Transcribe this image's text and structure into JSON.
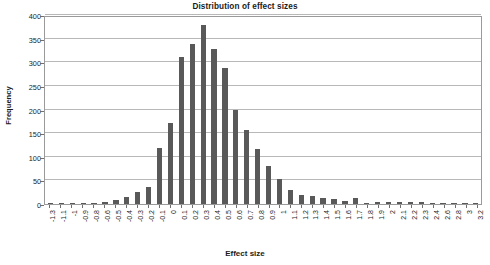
{
  "chart_data": {
    "type": "bar",
    "title": "Distribution of effect sizes",
    "xlabel": "Effect size",
    "ylabel": "Frequency",
    "ylim": [
      0,
      400
    ],
    "ytick_step": 50,
    "yticks": [
      0,
      50,
      100,
      150,
      200,
      250,
      300,
      350,
      400
    ],
    "grid": true,
    "legend": false,
    "bar_color": "#595959",
    "categories": [
      "-1.3",
      "-1.1",
      "-1",
      "-0.9",
      "-0.8",
      "-0.6",
      "-0.5",
      "-0.4",
      "-0.3",
      "-0.2",
      "-0.1",
      "0",
      "0.1",
      "0.2",
      "0.3",
      "0.4",
      "0.5",
      "0.6",
      "0.7",
      "0.8",
      "0.9",
      "1",
      "1.1",
      "1.2",
      "1.3",
      "1.4",
      "1.5",
      "1.6",
      "1.7",
      "1.8",
      "1.9",
      "2",
      "2.1",
      "2.2",
      "2.3",
      "2.4",
      "2.6",
      "2.8",
      "3",
      "3.2"
    ],
    "values": [
      2,
      2,
      2,
      2,
      2,
      4,
      9,
      15,
      25,
      35,
      118,
      172,
      311,
      338,
      378,
      329,
      288,
      200,
      157,
      117,
      80,
      53,
      29,
      20,
      16,
      12,
      10,
      7,
      12,
      2,
      4,
      4,
      4,
      4,
      5,
      2,
      2,
      2,
      2,
      2
    ]
  }
}
